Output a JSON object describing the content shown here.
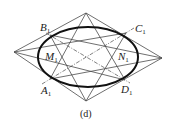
{
  "figure": {
    "caption": "(d)",
    "labels": {
      "B": {
        "letter": "B",
        "sub": "1"
      },
      "C": {
        "letter": "C",
        "sub": "1"
      },
      "A": {
        "letter": "A",
        "sub": "1"
      },
      "D": {
        "letter": "D",
        "sub": "1"
      },
      "M": {
        "letter": "M",
        "sub": "1"
      },
      "N": {
        "letter": "N",
        "sub": "1"
      }
    },
    "colors": {
      "ellipse": "#111111",
      "lines": "#4a4a4a",
      "text": "#222222"
    }
  }
}
